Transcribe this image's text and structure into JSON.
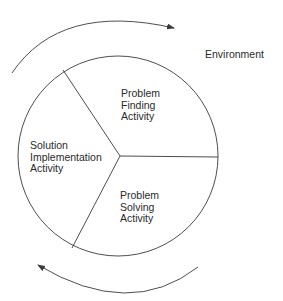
{
  "diagram": {
    "environment_label": "Environment",
    "segments": [
      {
        "id": "problem-finding",
        "lines": [
          "Problem",
          "Finding",
          "Activity"
        ]
      },
      {
        "id": "problem-solving",
        "lines": [
          "Problem",
          "Solving",
          "Activity"
        ]
      },
      {
        "id": "solution-implementation",
        "lines": [
          "Solution",
          "Implementation",
          "Activity"
        ]
      }
    ],
    "arrows": [
      {
        "id": "top-arrow",
        "direction": "clockwise"
      },
      {
        "id": "bottom-arrow",
        "direction": "clockwise"
      }
    ],
    "colors": {
      "stroke": "#3a3a3a",
      "text": "#2a2a2a",
      "background": "#ffffff"
    }
  }
}
